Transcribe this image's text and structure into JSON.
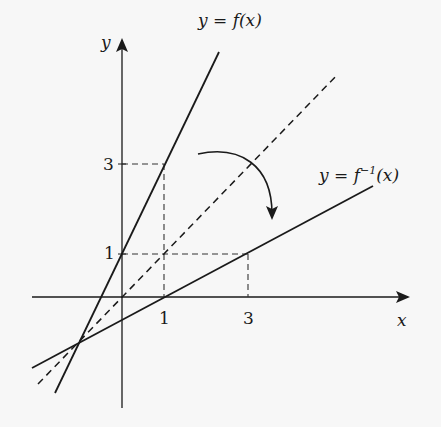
{
  "diagram": {
    "axes": {
      "x_label": "x",
      "y_label": "y",
      "x_ticks": [
        "1",
        "3"
      ],
      "y_ticks": [
        "1",
        "3"
      ]
    },
    "curves": [
      {
        "name": "f",
        "label_lhs": "y = f(x)",
        "style": "solid"
      },
      {
        "name": "f_inverse",
        "label_lhs": "y = f",
        "label_sup": "−1",
        "label_rhs": "(x)",
        "style": "solid"
      },
      {
        "name": "identity",
        "label_lhs": "y = x",
        "style": "dashed",
        "label_shown": false
      }
    ],
    "reference_points": [
      {
        "point": "(1, 3)",
        "on": "f"
      },
      {
        "point": "(3, 1)",
        "on": "f_inverse"
      }
    ],
    "annotation": "curved arrow indicating reflection from f to f^-1"
  },
  "text": {
    "y_axis": "y",
    "x_axis": "x",
    "tick_x1": "1",
    "tick_x3": "3",
    "tick_y1": "1",
    "tick_y3": "3",
    "f_label": "y = f(x)",
    "finv_prefix": "y = f",
    "finv_sup": "−1",
    "finv_suffix": "(x)"
  },
  "colors": {
    "line": "#1a1a1a",
    "background": "#f7f7f7"
  }
}
